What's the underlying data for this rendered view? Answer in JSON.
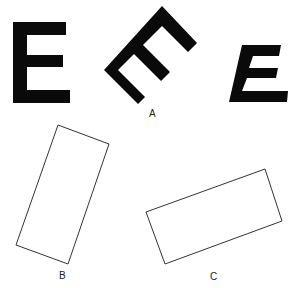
{
  "figure": {
    "panels": [
      {
        "id": "A",
        "label": "A",
        "items": [
          "upright E",
          "E rotated 45° clockwise",
          "italic (slanted) E"
        ]
      },
      {
        "id": "B",
        "label": "B",
        "items": [
          "tall rectangle rotated ~20°"
        ]
      },
      {
        "id": "C",
        "label": "C",
        "items": [
          "wide rectangle rotated ~-20°"
        ]
      }
    ],
    "colors": {
      "glyph": "#0a0a0a",
      "outline": "#333333",
      "background": "#ffffff"
    }
  },
  "labels": {
    "a": "A",
    "b": "B",
    "c": "C"
  }
}
